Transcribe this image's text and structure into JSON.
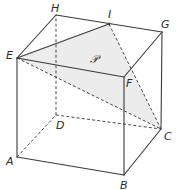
{
  "diagram": {
    "colors": {
      "edge": "#3a3a3a",
      "hidden_edge": "#4a4a4a",
      "plane_fill": "#ececec",
      "background": "#ffffff"
    },
    "vertices": {
      "A": {
        "label": "A",
        "x": 17,
        "y": 157
      },
      "B": {
        "label": "B",
        "x": 124,
        "y": 175
      },
      "C": {
        "label": "C",
        "x": 161,
        "y": 129
      },
      "D": {
        "label": "D",
        "x": 56,
        "y": 115
      },
      "E": {
        "label": "E",
        "x": 17,
        "y": 58
      },
      "F": {
        "label": "F",
        "x": 124,
        "y": 77
      },
      "G": {
        "label": "G",
        "x": 162,
        "y": 32
      },
      "H": {
        "label": "H",
        "x": 56,
        "y": 15
      },
      "I": {
        "label": "I",
        "x": 109,
        "y": 24
      }
    },
    "plane": {
      "label": "𝒫",
      "through": [
        "E",
        "I",
        "C"
      ]
    },
    "visible_edges": [
      "AB",
      "BC",
      "AE",
      "BF",
      "CG",
      "EF",
      "FG",
      "GH",
      "HE",
      "EI"
    ],
    "hidden_edges": [
      "AD",
      "DC",
      "DH",
      "EC",
      "IC"
    ]
  }
}
